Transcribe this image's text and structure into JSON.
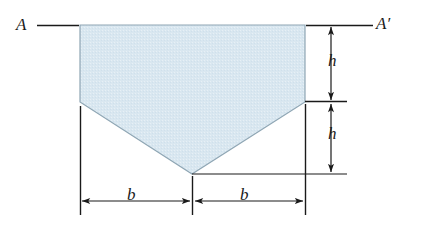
{
  "figure": {
    "type": "engineering-cross-section-diagram",
    "colors": {
      "fill": "#d9e7f0",
      "outline": "#8fa6b4",
      "line": "#1a1a1a",
      "background": "#ffffff"
    },
    "axis": {
      "left_label": "A",
      "right_label": "A′"
    },
    "dimensions": {
      "vertical_top": "h",
      "vertical_bottom": "h",
      "horizontal_left": "b",
      "horizontal_right": "b"
    },
    "geometry": {
      "top_y": 25,
      "shoulder_y": 102,
      "apex_y": 174,
      "left_x": 80,
      "center_x": 192,
      "right_x": 305,
      "outline_points": "80,25 305,25 305,102 192,174 80,102"
    }
  }
}
